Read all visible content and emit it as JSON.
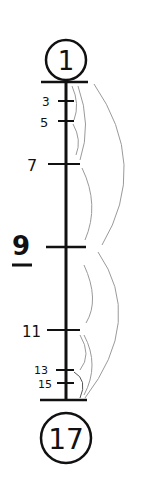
{
  "diagram": {
    "type": "number-line-tree",
    "start_node": {
      "label": "1"
    },
    "end_node": {
      "label": "17"
    },
    "ticks": [
      {
        "label": "3",
        "y": 101
      },
      {
        "label": "5",
        "y": 121
      },
      {
        "label": "7",
        "y": 164
      },
      {
        "label": "9",
        "y": 247,
        "emphasized": true
      },
      {
        "label": "11",
        "y": 330
      },
      {
        "label": "13",
        "y": 370
      },
      {
        "label": "15",
        "y": 383
      }
    ],
    "arcs": [
      {
        "from": "1",
        "to": "9"
      },
      {
        "from": "1",
        "to": "5"
      },
      {
        "from": "1",
        "to": "7"
      },
      {
        "from": "5",
        "to": "9"
      },
      {
        "from": "7",
        "to": "9"
      },
      {
        "from": "9",
        "to": "17"
      },
      {
        "from": "9",
        "to": "13"
      },
      {
        "from": "11",
        "to": "15"
      },
      {
        "from": "13",
        "to": "17"
      }
    ],
    "colors": {
      "ink": "#111111",
      "arc": "#9a9a9a",
      "background": "#ffffff"
    }
  }
}
